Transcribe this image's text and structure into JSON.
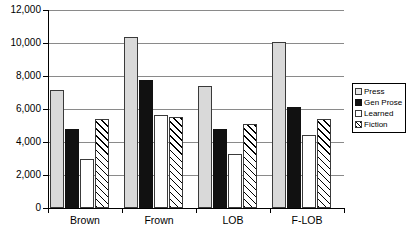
{
  "chart_data": {
    "type": "bar",
    "title": "",
    "xlabel": "",
    "ylabel": "",
    "ylim": [
      0,
      12000
    ],
    "yticks": [
      0,
      2000,
      4000,
      6000,
      8000,
      10000,
      12000
    ],
    "ytick_labels": [
      "0",
      "2,000",
      "4,000",
      "6,000",
      "8,000",
      "10,000",
      "12,000"
    ],
    "grid": true,
    "legend_position": "right",
    "categories": [
      "Brown",
      "Frown",
      "LOB",
      "F-LOB"
    ],
    "series": [
      {
        "name": "Press",
        "style": "light-gray-fill",
        "color": "#d9d9d9",
        "values": [
          7150,
          10350,
          7400,
          10050
        ]
      },
      {
        "name": "Gen Prose",
        "style": "black-fill",
        "color": "#111111",
        "values": [
          4800,
          7750,
          4800,
          6100
        ]
      },
      {
        "name": "Learned",
        "style": "white-fill",
        "color": "#ffffff",
        "values": [
          2950,
          5650,
          3250,
          4400
        ]
      },
      {
        "name": "Fiction",
        "style": "diagonal-hatch",
        "color": "#ffffff",
        "values": [
          5400,
          5500,
          5100,
          5400
        ]
      }
    ]
  },
  "legend": {
    "items": [
      {
        "label": "Press"
      },
      {
        "label": "Gen Prose"
      },
      {
        "label": "Learned"
      },
      {
        "label": "Fiction"
      }
    ]
  }
}
